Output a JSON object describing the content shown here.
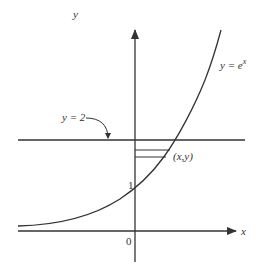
{
  "diagram": {
    "curve_label": "y = e",
    "curve_exp": "x",
    "line_label": "y = 2",
    "point_label": "(x,y)",
    "x_axis_label": "x",
    "y_axis_label": "y",
    "origin_label": "0",
    "y_tick_label": "1",
    "stroke_color": "#333333"
  }
}
